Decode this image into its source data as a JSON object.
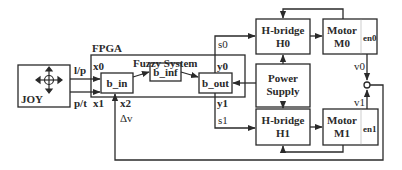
{
  "diagram": {
    "fpga_label": "FPGA",
    "fuzzy_system_label": "Fuzzy System",
    "joystick": {
      "label": "JOY",
      "icon": "joystick-cross-icon"
    },
    "inputs": {
      "lp": "l/p",
      "pt": "p/t",
      "x0": "x0",
      "x1": "x1",
      "x2": "x2"
    },
    "outputs": {
      "y0": "y0",
      "y1": "y1",
      "s0": "s0",
      "s1": "s1"
    },
    "blocks": {
      "b_in": "b_in",
      "b_inf": "b_inf",
      "b_out": "b_out",
      "hbridge0": {
        "line1": "H-bridge",
        "line2": "H0"
      },
      "hbridge1": {
        "line1": "H-bridge",
        "line2": "H1"
      },
      "motor0": {
        "line1": "Motor",
        "line2": "M0",
        "enc": "en0"
      },
      "motor1": {
        "line1": "Motor",
        "line2": "M1",
        "enc": "en1"
      },
      "power": {
        "line1": "Power",
        "line2": "Supply"
      }
    },
    "signals": {
      "v0": "v0",
      "v1": "v1",
      "dv": "Δv"
    },
    "colors": {
      "line": "#2a2a2a",
      "background": "#ffffff"
    }
  }
}
